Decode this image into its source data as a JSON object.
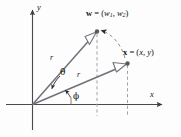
{
  "figure": {
    "background_color": "#fdfdfd",
    "axis_color": "#4a4a4a",
    "vector_color": "#6b6b72",
    "dashed_color": "#9a9a9a",
    "point_color": "#555555",
    "text_color": "#111111"
  },
  "axes": {
    "x_label": "x",
    "y_label": "y",
    "origin_label": ""
  },
  "vectors": [
    {
      "name": "w-vector",
      "label_bold": "w",
      "label_equals": " = (",
      "label_component_1": "w",
      "label_sub_1": "1",
      "label_comma": ", ",
      "label_component_2": "w",
      "label_sub_2": "2",
      "label_close": ")",
      "magnitude_label": "r",
      "tip_x": 97,
      "tip_y": 32,
      "angle_from_x_axis_deg": 63
    },
    {
      "name": "x-vector",
      "label_bold": "x",
      "label_equals": " = (",
      "label_component_1": "x",
      "label_comma": ", ",
      "label_component_2": "y",
      "label_close": ")",
      "magnitude_label": "r",
      "tip_x": 127,
      "tip_y": 63,
      "angle_from_x_axis_deg": 24
    }
  ],
  "angles": [
    {
      "name": "theta",
      "symbol": "θ",
      "description": "angle between x vector and w vector"
    },
    {
      "name": "phi",
      "symbol": "ϕ",
      "description": "angle between x axis and x vector"
    }
  ],
  "annotations": {
    "rotation_arc": "dashed arc from x tip to w tip with arrowhead at w",
    "drop_line_w": "dashed vertical from w tip to x axis",
    "drop_line_x": "dashed vertical from x tip to x axis"
  }
}
